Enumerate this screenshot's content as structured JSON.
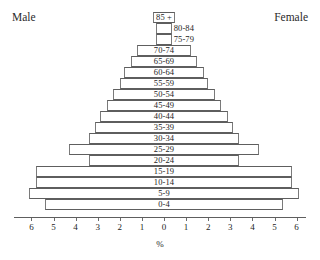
{
  "header": {
    "male_label": "Male",
    "female_label": "Female"
  },
  "axis": {
    "title": "%",
    "tick_labels": [
      "6",
      "5",
      "4",
      "3",
      "2",
      "1",
      "0",
      "1",
      "2",
      "3",
      "4",
      "5",
      "6"
    ]
  },
  "chart_data": {
    "type": "bar",
    "subtype": "population-pyramid",
    "title": "",
    "xlabel": "%",
    "ylabel": "",
    "xlim": [
      -6,
      6
    ],
    "grid": false,
    "legend": [
      "Male",
      "Female"
    ],
    "legend_position": "top-left-and-top-right",
    "orientation": "horizontal",
    "note": "Bars are outlined rectangles spanning symmetric male (left) and female (right) percentages; age-band label is printed inside each bar, except the three topmost narrow bars whose labels sit to the right.",
    "categories": [
      "85 +",
      "80-84",
      "75-79",
      "70-74",
      "65-69",
      "60-64",
      "55-59",
      "50-54",
      "45-49",
      "40-44",
      "35-39",
      "30-34",
      "25-29",
      "20-24",
      "15-19",
      "10-14",
      "5-9",
      "0-4"
    ],
    "series": [
      {
        "name": "Male",
        "values": [
          0.5,
          0.35,
          0.35,
          1.2,
          1.5,
          1.8,
          2.0,
          2.3,
          2.6,
          2.9,
          3.1,
          3.4,
          4.3,
          3.4,
          5.8,
          5.8,
          6.1,
          5.4
        ]
      },
      {
        "name": "Female",
        "values": [
          0.5,
          0.35,
          0.35,
          1.2,
          1.5,
          1.8,
          2.0,
          2.3,
          2.6,
          2.9,
          3.1,
          3.4,
          4.3,
          3.4,
          5.8,
          5.8,
          6.1,
          5.4
        ]
      }
    ],
    "bars": [
      {
        "category": "85 +",
        "male": 0.5,
        "female": 0.5,
        "label_placement": "outside"
      },
      {
        "category": "80-84",
        "male": 0.35,
        "female": 0.35,
        "label_placement": "outside"
      },
      {
        "category": "75-79",
        "male": 0.35,
        "female": 0.35,
        "label_placement": "outside"
      },
      {
        "category": "70-74",
        "male": 1.2,
        "female": 1.2,
        "label_placement": "inside"
      },
      {
        "category": "65-69",
        "male": 1.5,
        "female": 1.5,
        "label_placement": "inside"
      },
      {
        "category": "60-64",
        "male": 1.8,
        "female": 1.8,
        "label_placement": "inside"
      },
      {
        "category": "55-59",
        "male": 2.0,
        "female": 2.0,
        "label_placement": "inside"
      },
      {
        "category": "50-54",
        "male": 2.3,
        "female": 2.3,
        "label_placement": "inside"
      },
      {
        "category": "45-49",
        "male": 2.6,
        "female": 2.6,
        "label_placement": "inside"
      },
      {
        "category": "40-44",
        "male": 2.9,
        "female": 2.9,
        "label_placement": "inside"
      },
      {
        "category": "35-39",
        "male": 3.1,
        "female": 3.1,
        "label_placement": "inside"
      },
      {
        "category": "30-34",
        "male": 3.4,
        "female": 3.4,
        "label_placement": "inside"
      },
      {
        "category": "25-29",
        "male": 4.3,
        "female": 4.3,
        "label_placement": "inside"
      },
      {
        "category": "20-24",
        "male": 3.4,
        "female": 3.4,
        "label_placement": "inside"
      },
      {
        "category": "15-19",
        "male": 5.8,
        "female": 5.8,
        "label_placement": "inside"
      },
      {
        "category": "10-14",
        "male": 5.8,
        "female": 5.8,
        "label_placement": "inside"
      },
      {
        "category": "5-9",
        "male": 6.1,
        "female": 6.1,
        "label_placement": "inside"
      },
      {
        "category": "0-4",
        "male": 5.4,
        "female": 5.4,
        "label_placement": "inside"
      }
    ]
  },
  "style": {
    "bar_stroke": "#7a7a7a",
    "bar_fill": "#ffffff",
    "text_color": "#1d1d1d",
    "background": "#ffffff"
  }
}
